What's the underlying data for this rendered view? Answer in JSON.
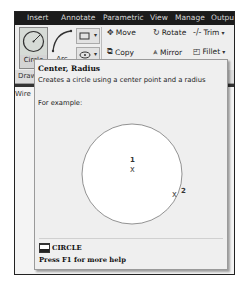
{
  "ribbon": {
    "tabs": [
      {
        "label": "Insert",
        "x": 12
      },
      {
        "label": "Annotate",
        "x": 46
      },
      {
        "label": "Parametric",
        "x": 88
      },
      {
        "label": "View",
        "x": 135
      },
      {
        "label": "Manage",
        "x": 160
      },
      {
        "label": "Output",
        "x": 196
      }
    ],
    "draw": {
      "circle_label": "Circle",
      "arc_label": "Arc",
      "rectangle_caret": "▾",
      "ellipse_caret": "▾"
    },
    "modify": {
      "move_label": "Move",
      "rotate_label": "Rotate",
      "trim_label": "Trim",
      "copy_label": "Copy",
      "mirror_label": "Mirror",
      "fillet_label": "Fillet",
      "trim_caret": "▾",
      "fillet_caret": "▾"
    },
    "panel_label": "Draw",
    "viewport_label": "Wire"
  },
  "tooltip": {
    "title": "Center, Radius",
    "description": "Creates a circle using a center point and a radius",
    "example_label": "For example:",
    "point1_label": "1",
    "point2_label": "2",
    "marker": "x",
    "command_name": "CIRCLE",
    "help_text": "Press F1 for more help"
  }
}
